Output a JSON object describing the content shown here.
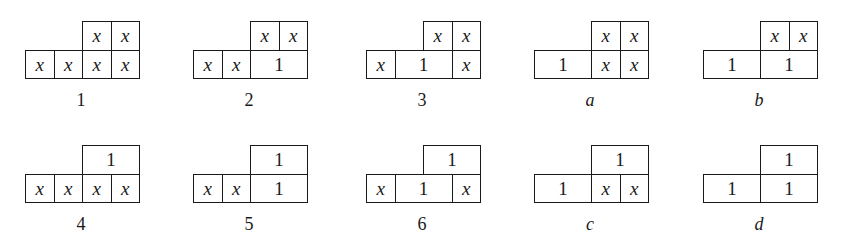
{
  "cell_size_px": 28.5,
  "diagrams": [
    {
      "id": "1",
      "label": "1",
      "italic_label": false,
      "pos": [
        25,
        21
      ],
      "top": [
        {
          "span": 1,
          "v": "x"
        },
        {
          "span": 1,
          "v": "x"
        }
      ],
      "bottom": [
        {
          "span": 1,
          "v": "x"
        },
        {
          "span": 1,
          "v": "x"
        },
        {
          "span": 1,
          "v": "x"
        },
        {
          "span": 1,
          "v": "x"
        }
      ]
    },
    {
      "id": "2",
      "label": "2",
      "italic_label": false,
      "pos": [
        193,
        21
      ],
      "top": [
        {
          "span": 1,
          "v": "x"
        },
        {
          "span": 1,
          "v": "x"
        }
      ],
      "bottom": [
        {
          "span": 1,
          "v": "x"
        },
        {
          "span": 1,
          "v": "x"
        },
        {
          "span": 2,
          "v": "1"
        }
      ]
    },
    {
      "id": "3",
      "label": "3",
      "italic_label": false,
      "pos": [
        366,
        21
      ],
      "top": [
        {
          "span": 1,
          "v": "x"
        },
        {
          "span": 1,
          "v": "x"
        }
      ],
      "bottom": [
        {
          "span": 1,
          "v": "x"
        },
        {
          "span": 2,
          "v": "1"
        },
        {
          "span": 1,
          "v": "x"
        }
      ]
    },
    {
      "id": "a",
      "label": "a",
      "italic_label": true,
      "pos": [
        534,
        21
      ],
      "top": [
        {
          "span": 1,
          "v": "x"
        },
        {
          "span": 1,
          "v": "x"
        }
      ],
      "bottom": [
        {
          "span": 2,
          "v": "1"
        },
        {
          "span": 1,
          "v": "x"
        },
        {
          "span": 1,
          "v": "x"
        }
      ]
    },
    {
      "id": "b",
      "label": "b",
      "italic_label": true,
      "pos": [
        703,
        21
      ],
      "top": [
        {
          "span": 1,
          "v": "x"
        },
        {
          "span": 1,
          "v": "x"
        }
      ],
      "bottom": [
        {
          "span": 2,
          "v": "1"
        },
        {
          "span": 2,
          "v": "1"
        }
      ]
    },
    {
      "id": "4",
      "label": "4",
      "italic_label": false,
      "pos": [
        25,
        145
      ],
      "top": [
        {
          "span": 2,
          "v": "1"
        }
      ],
      "bottom": [
        {
          "span": 1,
          "v": "x"
        },
        {
          "span": 1,
          "v": "x"
        },
        {
          "span": 1,
          "v": "x"
        },
        {
          "span": 1,
          "v": "x"
        }
      ]
    },
    {
      "id": "5",
      "label": "5",
      "italic_label": false,
      "pos": [
        193,
        145
      ],
      "top": [
        {
          "span": 2,
          "v": "1"
        }
      ],
      "bottom": [
        {
          "span": 1,
          "v": "x"
        },
        {
          "span": 1,
          "v": "x"
        },
        {
          "span": 2,
          "v": "1"
        }
      ]
    },
    {
      "id": "6",
      "label": "6",
      "italic_label": false,
      "pos": [
        366,
        145
      ],
      "top": [
        {
          "span": 2,
          "v": "1"
        }
      ],
      "bottom": [
        {
          "span": 1,
          "v": "x"
        },
        {
          "span": 2,
          "v": "1"
        },
        {
          "span": 1,
          "v": "x"
        }
      ]
    },
    {
      "id": "c",
      "label": "c",
      "italic_label": true,
      "pos": [
        534,
        145
      ],
      "top": [
        {
          "span": 2,
          "v": "1"
        }
      ],
      "bottom": [
        {
          "span": 2,
          "v": "1"
        },
        {
          "span": 1,
          "v": "x"
        },
        {
          "span": 1,
          "v": "x"
        }
      ]
    },
    {
      "id": "d",
      "label": "d",
      "italic_label": true,
      "pos": [
        703,
        145
      ],
      "top": [
        {
          "span": 2,
          "v": "1"
        }
      ],
      "bottom": [
        {
          "span": 2,
          "v": "1"
        },
        {
          "span": 2,
          "v": "1"
        }
      ]
    }
  ]
}
